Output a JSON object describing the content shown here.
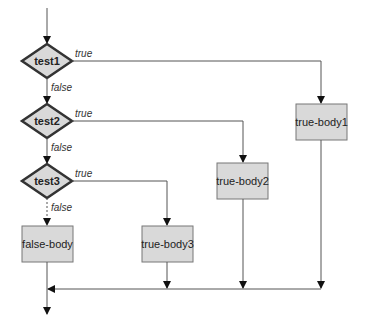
{
  "diagram": {
    "type": "flowchart",
    "colors": {
      "node_fill": "#d9d9d9",
      "node_stroke": "#555555",
      "line": "#555555",
      "arrow": "#111111",
      "background": "#ffffff"
    },
    "decisions": [
      {
        "id": "test1",
        "label": "test1",
        "true_label": "true",
        "false_label": "false"
      },
      {
        "id": "test2",
        "label": "test2",
        "true_label": "true",
        "false_label": "false"
      },
      {
        "id": "test3",
        "label": "test3",
        "true_label": "true",
        "false_label": "false"
      }
    ],
    "processes": [
      {
        "id": "true-body1",
        "label": "true-body1"
      },
      {
        "id": "true-body2",
        "label": "true-body2"
      },
      {
        "id": "true-body3",
        "label": "true-body3"
      },
      {
        "id": "false-body",
        "label": "false-body"
      }
    ],
    "edges": [
      {
        "from": "start",
        "to": "test1",
        "label": ""
      },
      {
        "from": "test1",
        "to": "true-body1",
        "label": "true"
      },
      {
        "from": "test1",
        "to": "test2",
        "label": "false"
      },
      {
        "from": "test2",
        "to": "true-body2",
        "label": "true"
      },
      {
        "from": "test2",
        "to": "test3",
        "label": "false"
      },
      {
        "from": "test3",
        "to": "true-body3",
        "label": "true"
      },
      {
        "from": "test3",
        "to": "false-body",
        "label": "false"
      },
      {
        "from": "true-body1",
        "to": "merge",
        "label": ""
      },
      {
        "from": "true-body2",
        "to": "merge",
        "label": ""
      },
      {
        "from": "true-body3",
        "to": "merge",
        "label": ""
      },
      {
        "from": "false-body",
        "to": "merge",
        "label": ""
      },
      {
        "from": "merge",
        "to": "end",
        "label": ""
      }
    ]
  }
}
